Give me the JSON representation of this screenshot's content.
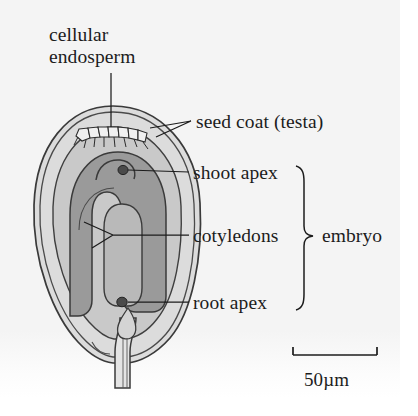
{
  "figure": {
    "labels": {
      "cellular_endosperm_line1": "cellular",
      "cellular_endosperm_line2": "endosperm",
      "seed_coat": "seed coat (testa)",
      "shoot_apex": "shoot apex",
      "cotyledons": "cotyledons",
      "root_apex": "root apex",
      "embryo": "embryo"
    },
    "scale_bar": {
      "label": "50µm",
      "value": 50,
      "unit": "µm"
    },
    "colors": {
      "background": "#f4f4f4",
      "page": "#ffffff",
      "ink": "#1c1c1c",
      "seed_coat_fill": "#dcdcdc",
      "endosperm_fill": "#c9c9c9",
      "cotyledon_fill": "#9a9a9a",
      "inner_cotyledon_fill": "#b9b9b9",
      "apex_dot": "#4a4a4a",
      "outline": "#3a3a3a"
    },
    "structures": [
      {
        "name": "seed-coat-testa",
        "label_ref": "seed_coat"
      },
      {
        "name": "cellular-endosperm",
        "label_ref": "cellular_endosperm_line1"
      },
      {
        "name": "shoot-apex",
        "label_ref": "shoot_apex"
      },
      {
        "name": "cotyledons",
        "label_ref": "cotyledons"
      },
      {
        "name": "root-apex",
        "label_ref": "root_apex"
      },
      {
        "name": "funiculus",
        "label_ref": null
      }
    ],
    "embryo_group_members": [
      "shoot apex",
      "cotyledons",
      "root apex"
    ],
    "endosperm_cell_count": 7
  }
}
